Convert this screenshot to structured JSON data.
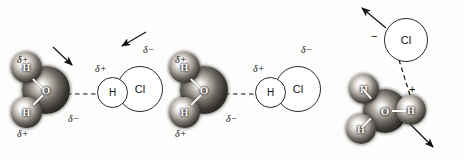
{
  "figure": {
    "background_color": "#fdfdfc",
    "ink_color": "#111111",
    "panel_count": 3
  },
  "atom_labels": {
    "oxygen": "O",
    "hydrogen": "H",
    "chlorine": "Cl"
  },
  "charge_labels": {
    "delta_plus": "δ+",
    "delta_minus": "δ−",
    "minus": "−",
    "plus": "+"
  },
  "panels": [
    {
      "id": "panel-1",
      "name": "approach",
      "water": {
        "oxygen": "O",
        "hydrogen_upper": "H",
        "hydrogen_lower": "H",
        "labels": {
          "delta_plus_top": "δ+",
          "delta_plus_bottom": "δ+",
          "delta_minus": "δ−"
        }
      },
      "hcl": {
        "hydrogen": "H",
        "chlorine": "Cl",
        "labels": {
          "delta_plus": "δ+",
          "delta_minus": "δ−"
        }
      },
      "hydrogen_bond": "dashed",
      "arrows": [
        {
          "name": "arrow-water-inward",
          "direction": "down-right"
        },
        {
          "name": "arrow-hcl-inward",
          "direction": "down-left"
        }
      ]
    },
    {
      "id": "panel-2",
      "name": "hydrogen-bonded-complex",
      "water": {
        "oxygen": "O",
        "hydrogen_upper": "H",
        "hydrogen_lower": "H",
        "labels": {
          "delta_plus_top": "δ+",
          "delta_plus_bottom": "δ+",
          "delta_minus": "δ−"
        }
      },
      "hcl": {
        "hydrogen": "H",
        "chlorine": "Cl",
        "labels": {
          "delta_plus": "δ+",
          "delta_minus": "δ−"
        }
      },
      "hydrogen_bond": "dashed",
      "arrows": []
    },
    {
      "id": "panel-3",
      "name": "ion-separation",
      "hydronium": {
        "oxygen": "O",
        "hydrogen_upper_left": "H",
        "hydrogen_lower_left": "H",
        "hydrogen_right": "H",
        "charge": "+"
      },
      "chloride": {
        "chlorine": "Cl",
        "charge": "−"
      },
      "hydrogen_bond": "dashed",
      "arrows": [
        {
          "name": "arrow-chloride-away",
          "direction": "up-left"
        },
        {
          "name": "arrow-hydronium-away",
          "direction": "down-right"
        }
      ]
    }
  ]
}
